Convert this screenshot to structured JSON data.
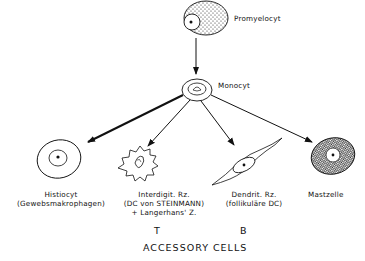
{
  "diagram": {
    "title": "ACCESSORY CELLS",
    "nodes": {
      "promyelocyt": {
        "label": "Promyelocyt"
      },
      "monocyt": {
        "label": "Monocyt"
      },
      "histiocyt": {
        "label_line1": "Histiocyt",
        "label_line2": "(Gewebsmakrophagen)"
      },
      "interdigit": {
        "label_line1": "Interdigit. Rz.",
        "label_line2": "(DC von STEINMANN)",
        "label_line3": "+ Langerhans' Z."
      },
      "dendrit": {
        "label_line1": "Dendrit. Rz.",
        "label_line2": "(follikuläre DC)"
      },
      "mastzelle": {
        "label": "Mastzelle"
      }
    },
    "group_labels": {
      "t": "T",
      "b": "B"
    },
    "edges": [
      {
        "from": "Promyelocyt",
        "to": "Monocyt"
      },
      {
        "from": "Monocyt",
        "to": "Histiocyt",
        "emphasis": "bold"
      },
      {
        "from": "Monocyt",
        "to": "Interdigit. Rz."
      },
      {
        "from": "Monocyt",
        "to": "Dendrit. Rz."
      },
      {
        "from": "Monocyt",
        "to": "Mastzelle"
      }
    ]
  }
}
